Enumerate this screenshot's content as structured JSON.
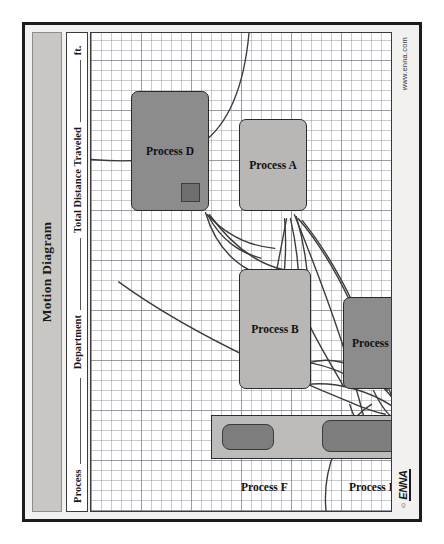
{
  "document": {
    "title": "Motion Diagram",
    "logo_copyright": "©",
    "logo_mark": "ENNA",
    "url": "www.enna.com"
  },
  "header_fields": [
    {
      "label": "Process",
      "value": ""
    },
    {
      "label": "Department",
      "value": ""
    },
    {
      "label": "Total Distance Traveled",
      "value": "",
      "units": "ft."
    }
  ],
  "grid": {
    "minor_cell_px": 10,
    "major_cell_px": 50,
    "line_color": "#787d87",
    "background": "#ffffff"
  },
  "colors": {
    "sheet_background": "#f2f1ef",
    "title_bar": "#c9c7c4",
    "box_light": "#b8b7b5",
    "box_dark": "#8c8c8c",
    "bar_zone": "#bdbcba",
    "pill": "#7d7d7d",
    "corner_chip": "#6e6e6e",
    "outline": "#2b2b2b",
    "path_stroke": "#3c3c3c"
  },
  "process_boxes": [
    {
      "id": "d",
      "label": "Process D",
      "shade": "dark",
      "x": 300,
      "y": 40,
      "w": 120,
      "h": 78,
      "chip": true
    },
    {
      "id": "a",
      "label": "Process A",
      "shade": "light",
      "x": 300,
      "y": 148,
      "w": 92,
      "h": 68,
      "chip": false
    },
    {
      "id": "b",
      "label": "Process B",
      "shade": "light",
      "x": 122,
      "y": 148,
      "w": 120,
      "h": 72,
      "chip": false
    },
    {
      "id": "c",
      "label": "Process C",
      "shade": "dark",
      "x": 122,
      "y": 252,
      "w": 92,
      "h": 66,
      "chip": false
    }
  ],
  "bar_zone": {
    "x": 52,
    "y": 120,
    "w": 44,
    "h": 228,
    "pills": [
      {
        "id": "f",
        "x": 8,
        "y": 10,
        "w": 26,
        "h": 52
      },
      {
        "id": "e",
        "x": 6,
        "y": 110,
        "w": 32,
        "h": 82
      }
    ]
  },
  "external_labels": [
    {
      "id": "f",
      "label": "Process F",
      "x": 30,
      "y": 150
    },
    {
      "id": "e",
      "label": "Process E",
      "x": 30,
      "y": 258
    }
  ],
  "spaghetti_paths": {
    "description": "Hand-drawn motion travel lines connecting the process stations",
    "stroke_width": 1.4,
    "count": 17
  }
}
